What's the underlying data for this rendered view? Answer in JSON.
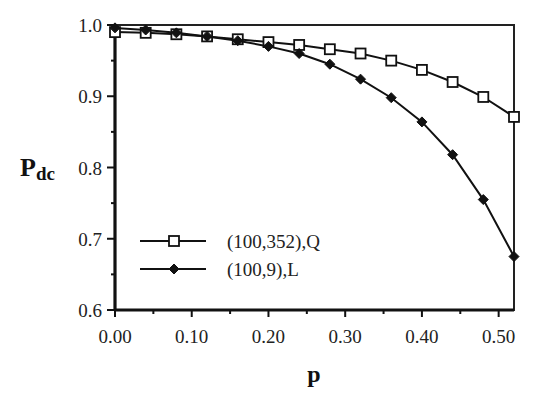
{
  "chart_data": {
    "type": "line",
    "title": "",
    "xlabel": "p",
    "ylabel": "Pdc",
    "ylabel_main": "P",
    "ylabel_sub": "dc",
    "xlim": [
      0.0,
      0.52
    ],
    "ylim": [
      0.6,
      1.0
    ],
    "grid": false,
    "legend_position": "lower left",
    "x_ticks": [
      "0.00",
      "0.10",
      "0.20",
      "0.30",
      "0.40",
      "0.50"
    ],
    "x_tick_values": [
      0.0,
      0.1,
      0.2,
      0.3,
      0.4,
      0.5
    ],
    "y_ticks": [
      "0.6",
      "0.7",
      "0.8",
      "0.9",
      "1.0"
    ],
    "y_tick_values": [
      0.6,
      0.7,
      0.8,
      0.9,
      1.0
    ],
    "x": [
      0.0,
      0.04,
      0.08,
      0.12,
      0.16,
      0.2,
      0.24,
      0.28,
      0.32,
      0.36,
      0.4,
      0.44,
      0.48,
      0.52
    ],
    "series": [
      {
        "name": "(100,352),Q",
        "marker": "open-square",
        "values": [
          0.99,
          0.989,
          0.987,
          0.984,
          0.98,
          0.976,
          0.972,
          0.966,
          0.96,
          0.95,
          0.937,
          0.92,
          0.899,
          0.871
        ]
      },
      {
        "name": "(100,9),L",
        "marker": "filled-diamond",
        "values": [
          0.996,
          0.993,
          0.989,
          0.984,
          0.978,
          0.97,
          0.96,
          0.945,
          0.924,
          0.898,
          0.864,
          0.818,
          0.755,
          0.675
        ]
      }
    ]
  }
}
